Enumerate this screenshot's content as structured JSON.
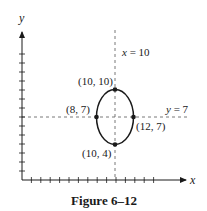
{
  "figure": {
    "caption": "Figure 6–12",
    "axes": {
      "x_label": "x",
      "y_label": "y",
      "x_ticks": [
        1,
        2,
        3,
        4,
        5,
        6,
        7,
        8,
        9,
        10,
        11,
        12,
        13,
        14
      ],
      "y_ticks": [
        1,
        2,
        3,
        4,
        5,
        6,
        7,
        8,
        9,
        10,
        11,
        12,
        13,
        14
      ]
    },
    "reference_lines": [
      {
        "label_var": "x",
        "label_rest": " = 10",
        "orientation": "vertical",
        "value": 10,
        "style": "dashed"
      },
      {
        "label_var": "y",
        "label_rest": " = 7",
        "orientation": "horizontal",
        "value": 7,
        "style": "dashed"
      }
    ],
    "ellipse": {
      "center": [
        10,
        7
      ],
      "semi_axis_x": 2,
      "semi_axis_y": 3
    },
    "points": [
      {
        "label": "(10, 10)",
        "x": 10,
        "y": 10
      },
      {
        "label": "(8, 7)",
        "x": 8,
        "y": 7
      },
      {
        "label": "(12, 7)",
        "x": 12,
        "y": 7
      },
      {
        "label": "(10, 4)",
        "x": 10,
        "y": 4
      }
    ],
    "colors": {
      "ink": "#1a1a1a",
      "dashed": "#555555",
      "background": "#ffffff"
    }
  }
}
